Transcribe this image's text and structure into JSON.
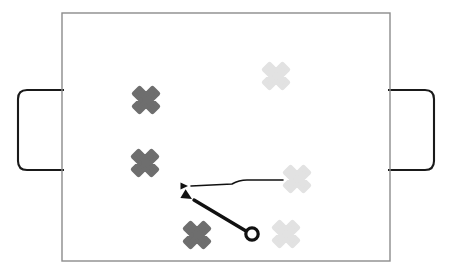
{
  "app": {
    "title": "Tactics Board",
    "surface_color": "#ffffff"
  },
  "pitch": {
    "name": "pitch",
    "label": "Playing field",
    "x": 62,
    "y": 13,
    "width": 328,
    "height": 248,
    "border_color": "#8c8c8c",
    "border_width": 1.4,
    "fill_color": "#ffffff"
  },
  "goals": [
    {
      "name": "goal-left",
      "label": "Left goal",
      "x": 18,
      "y": 90,
      "width": 46,
      "height": 80,
      "radius": 9,
      "side": "left",
      "border_color": "#1a1a1a",
      "border_width": 2.1,
      "fill_color": "#ffffff"
    },
    {
      "name": "goal-right",
      "label": "Right goal",
      "x": 388,
      "y": 90,
      "width": 46,
      "height": 80,
      "radius": 9,
      "side": "right",
      "border_color": "#1a1a1a",
      "border_width": 2.1,
      "fill_color": "#ffffff"
    }
  ],
  "colors": {
    "dark_team": "#6e6e6e",
    "light_team": "#e2e2e2",
    "ball_outline": "#111111",
    "arrow_dark": "#111111"
  },
  "players": [
    {
      "name": "player-dark-1",
      "team": "dark",
      "label": "Dark player 1",
      "cx": 146,
      "cy": 100,
      "size": 26,
      "color": "#6e6e6e"
    },
    {
      "name": "player-dark-2",
      "team": "dark",
      "label": "Dark player 2",
      "cx": 145,
      "cy": 163,
      "size": 26,
      "color": "#6e6e6e"
    },
    {
      "name": "player-dark-3",
      "team": "dark",
      "label": "Dark player 3",
      "cx": 197,
      "cy": 235,
      "size": 26,
      "color": "#6e6e6e"
    },
    {
      "name": "player-light-1",
      "team": "light",
      "label": "Light player 1",
      "cx": 276,
      "cy": 76,
      "size": 26,
      "color": "#e2e2e2"
    },
    {
      "name": "player-light-2",
      "team": "light",
      "label": "Light player 2",
      "cx": 297,
      "cy": 179,
      "size": 26,
      "color": "#e2e2e2"
    },
    {
      "name": "player-light-3",
      "team": "light",
      "label": "Light player 3",
      "cx": 286,
      "cy": 234,
      "size": 26,
      "color": "#e2e2e2"
    }
  ],
  "ball": {
    "name": "ball",
    "label": "Ball",
    "cx": 252,
    "cy": 234,
    "radius": 6.2,
    "stroke_width": 3.2,
    "outline_color": "#111111",
    "fill_color": "#ffffff"
  },
  "arrows": [
    {
      "name": "run-arrow",
      "label": "Run arrow",
      "kind": "run",
      "path": "M 283 180 L 247 180 Q 239 180 232 184 L 191 186",
      "stroke_width": 1.6,
      "color": "#111111",
      "head_x": 188,
      "head_y": 186,
      "head_size": 5,
      "head_angle": 180
    },
    {
      "name": "pass-arrow",
      "label": "Pass arrow",
      "kind": "pass",
      "path": "M 246 231 L 194 200",
      "stroke_width": 3.4,
      "color": "#111111",
      "head_x": 192,
      "head_y": 199,
      "head_size": 7,
      "head_angle": 211
    }
  ]
}
